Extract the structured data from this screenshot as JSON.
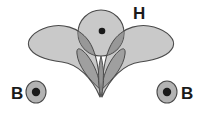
{
  "figure": {
    "name": "orbital-overlap-diagram",
    "width": 202,
    "height": 115,
    "background_color": "#ffffff"
  },
  "colors": {
    "lobe_fill": "#c9c9c9",
    "lobe_stroke": "#4a4a4a",
    "circle_fill": "#c4c4c4",
    "circle_stroke": "#4a4a4a",
    "overlap_fill": "#8f8f8f",
    "overlap_dark_fill": "#7d7d7d",
    "core_fill": "#b3b3b3",
    "core_stroke": "#4a4a4a",
    "nucleus_dot": "#1a1a1a",
    "label_color": "#1a1a1a"
  },
  "labels": {
    "hydrogen": {
      "text": "H",
      "x": 133,
      "y": 19,
      "font_size": 17
    },
    "boron_left": {
      "text": "B",
      "x": 11,
      "y": 99,
      "font_size": 17
    },
    "boron_right": {
      "text": "B",
      "x": 181,
      "y": 99,
      "font_size": 17
    }
  },
  "shapes": {
    "lobe_left": {
      "name": "boron-hybrid-orbital-lobe-left",
      "apex_x": 100,
      "apex_y": 97,
      "max_width": 76,
      "top_y": 26
    },
    "lobe_right": {
      "name": "boron-hybrid-orbital-lobe-right",
      "apex_x": 102,
      "apex_y": 97,
      "max_width": 76,
      "top_y": 26
    },
    "hydrogen_orbital": {
      "name": "hydrogen-1s-orbital",
      "cx": 101,
      "cy": 33,
      "r": 23
    },
    "hydrogen_nucleus": {
      "name": "hydrogen-nucleus-dot",
      "cx": 102,
      "cy": 31,
      "r": 3.2
    },
    "boron_core_left": {
      "name": "boron-core-left",
      "cx": 36,
      "cy": 92,
      "rx": 10,
      "ry": 11
    },
    "boron_nucleus_left": {
      "name": "boron-nucleus-dot-left",
      "cx": 36,
      "cy": 92,
      "r": 4.2
    },
    "boron_core_right": {
      "name": "boron-core-right",
      "cx": 167,
      "cy": 92,
      "rx": 10,
      "ry": 11
    },
    "boron_nucleus_right": {
      "name": "boron-nucleus-dot-right",
      "cx": 167,
      "cy": 92,
      "r": 4.2
    }
  }
}
